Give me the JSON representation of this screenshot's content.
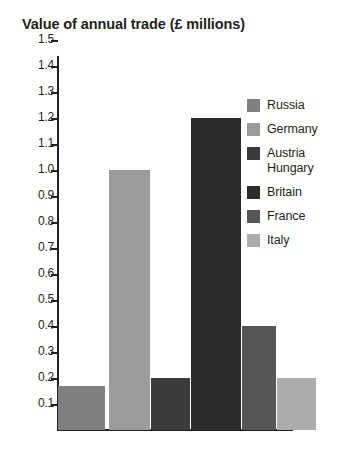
{
  "chart_data": {
    "type": "bar",
    "title": "Value of annual trade (£ millions)",
    "xlabel": "",
    "ylabel": "",
    "ylim": [
      0.0,
      1.5
    ],
    "ytick_step": 0.1,
    "ytick_labels": [
      "1.5",
      "1.4",
      "1.3",
      "1.2",
      "1.1",
      "1.0",
      "0.9",
      "0.8",
      "0.7",
      "0.6",
      "0.5",
      "0.4",
      "0.3",
      "0.2",
      "0.1"
    ],
    "grid": false,
    "legend_position": "right",
    "categories": [
      "Russia",
      "Germany",
      "Austria Hungary",
      "Britain",
      "France",
      "Italy"
    ],
    "values": [
      0.17,
      1.0,
      0.2,
      1.2,
      0.4,
      0.2
    ],
    "series": [
      {
        "name": "Value of annual trade",
        "values": [
          0.17,
          1.0,
          0.2,
          1.2,
          0.4,
          0.2
        ]
      }
    ],
    "bars": [
      {
        "label": "Russia",
        "value": 0.17,
        "color": "#7f7f7f"
      },
      {
        "label": "Germany",
        "value": 1.0,
        "color": "#9b9b9b"
      },
      {
        "label": "Austria Hungary",
        "value": 0.2,
        "color": "#3b3b3b"
      },
      {
        "label": "Britain",
        "value": 1.2,
        "color": "#2b2b2b"
      },
      {
        "label": "France",
        "value": 0.4,
        "color": "#565656"
      },
      {
        "label": "Italy",
        "value": 0.2,
        "color": "#acacac"
      }
    ]
  },
  "legend": {
    "items": [
      {
        "label": "Russia",
        "label_line2": "",
        "color": "#7f7f7f"
      },
      {
        "label": "Germany",
        "label_line2": "",
        "color": "#9b9b9b"
      },
      {
        "label": "Austria",
        "label_line2": "Hungary",
        "color": "#3b3b3b"
      },
      {
        "label": "Britain",
        "label_line2": "",
        "color": "#2b2b2b"
      },
      {
        "label": "France",
        "label_line2": "",
        "color": "#565656"
      },
      {
        "label": "Italy",
        "label_line2": "",
        "color": "#acacac"
      }
    ]
  },
  "colors": {
    "axis": "#231f20",
    "text": "#231f20",
    "background": "#ffffff"
  }
}
